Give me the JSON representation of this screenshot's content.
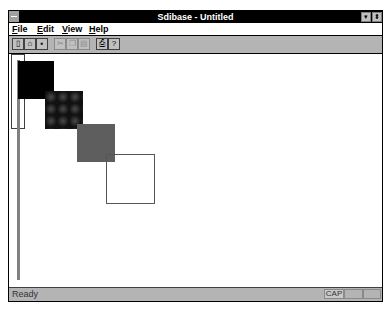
{
  "window": {
    "title": "Sdibase - Untitled",
    "minimize_glyph": "▾",
    "maximize_glyph": "⬍"
  },
  "menu": {
    "items": [
      {
        "label": "File",
        "mnemonic": "F",
        "rest": "ile"
      },
      {
        "label": "Edit",
        "mnemonic": "E",
        "rest": "dit"
      },
      {
        "label": "View",
        "mnemonic": "V",
        "rest": "iew"
      },
      {
        "label": "Help",
        "mnemonic": "H",
        "rest": "elp"
      }
    ]
  },
  "toolbar": {
    "buttons": [
      {
        "name": "new-icon",
        "glyph": "▯",
        "enabled": true
      },
      {
        "name": "open-icon",
        "glyph": "⌂",
        "enabled": true
      },
      {
        "name": "save-icon",
        "glyph": "▪",
        "enabled": true
      },
      {
        "name": "cut-icon",
        "glyph": "✂",
        "enabled": false
      },
      {
        "name": "copy-icon",
        "glyph": "❐",
        "enabled": false
      },
      {
        "name": "paste-icon",
        "glyph": "▤",
        "enabled": false
      },
      {
        "name": "print-icon",
        "glyph": "⎙",
        "enabled": true
      },
      {
        "name": "help-icon",
        "glyph": "?",
        "enabled": true
      }
    ]
  },
  "canvas": {
    "shapes": [
      {
        "type": "outline-rect",
        "x": 2,
        "y": 0,
        "w": 14,
        "h": 75,
        "border": "#404040",
        "fill": "transparent"
      },
      {
        "type": "gray-bar",
        "x": 8,
        "y": 6,
        "w": 3,
        "h": 220,
        "border": "none",
        "fill": "#808080"
      },
      {
        "type": "black-square",
        "x": 9,
        "y": 7,
        "w": 36,
        "h": 38,
        "border": "none",
        "fill": "#000000"
      },
      {
        "type": "patterned-square",
        "x": 36,
        "y": 37,
        "w": 38,
        "h": 38,
        "border": "none",
        "fill": "#2a2a2a"
      },
      {
        "type": "gray-square",
        "x": 68,
        "y": 70,
        "w": 38,
        "h": 38,
        "border": "none",
        "fill": "#5e5e5e"
      },
      {
        "type": "outline-square",
        "x": 97,
        "y": 100,
        "w": 49,
        "h": 50,
        "border": "#555555",
        "fill": "transparent"
      }
    ]
  },
  "status": {
    "text": "Ready",
    "indicators": [
      "CAP",
      "",
      ""
    ]
  }
}
